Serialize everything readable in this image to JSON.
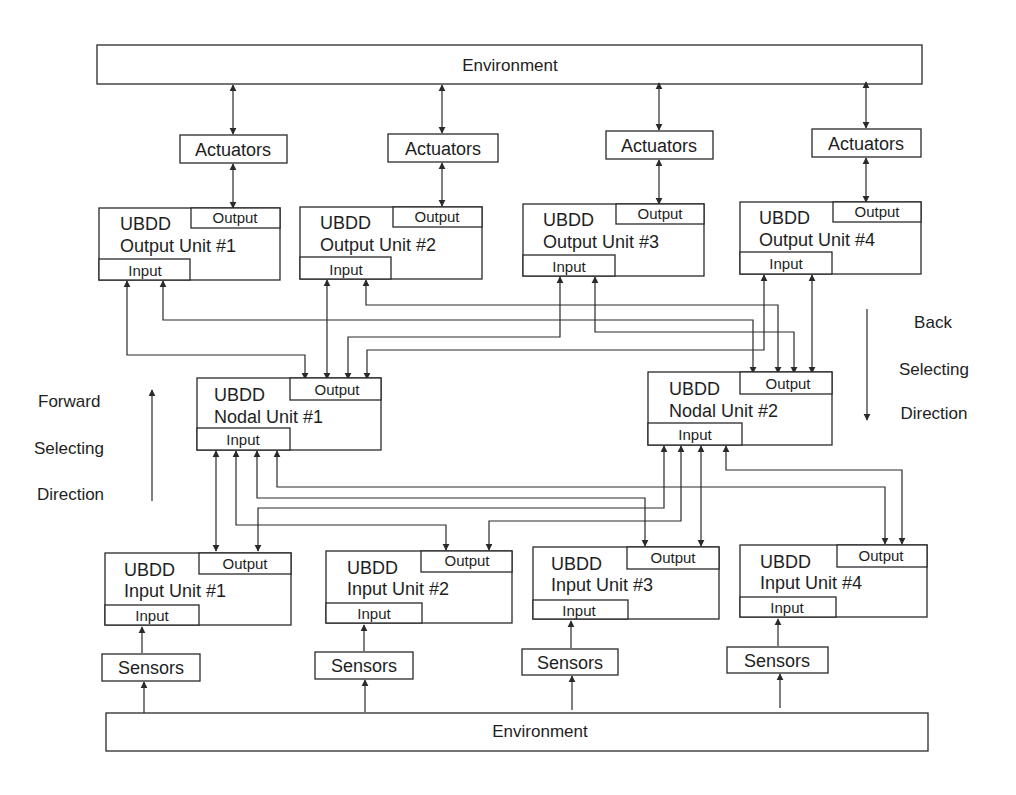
{
  "diagram": {
    "environment_top": "Environment",
    "environment_bottom": "Environment",
    "actuators": [
      "Actuators",
      "Actuators",
      "Actuators",
      "Actuators"
    ],
    "sensors": [
      "Sensors",
      "Sensors",
      "Sensors",
      "Sensors"
    ],
    "output_units": [
      {
        "title": "UBDD",
        "name": "Output Unit #1",
        "output_port": "Output",
        "input_port": "Input"
      },
      {
        "title": "UBDD",
        "name": "Output Unit #2",
        "output_port": "Output",
        "input_port": "Input"
      },
      {
        "title": "UBDD",
        "name": "Output Unit #3",
        "output_port": "Output",
        "input_port": "Input"
      },
      {
        "title": "UBDD",
        "name": "Output Unit #4",
        "output_port": "Output",
        "input_port": "Input"
      }
    ],
    "nodal_units": [
      {
        "title": "UBDD",
        "name": "Nodal Unit #1",
        "output_port": "Output",
        "input_port": "Input"
      },
      {
        "title": "UBDD",
        "name": "Nodal Unit #2",
        "output_port": "Output",
        "input_port": "Input"
      }
    ],
    "input_units": [
      {
        "title": "UBDD",
        "name": "Input Unit #1",
        "output_port": "Output",
        "input_port": "Input"
      },
      {
        "title": "UBDD",
        "name": "Input Unit #2",
        "output_port": "Output",
        "input_port": "Input"
      },
      {
        "title": "UBDD",
        "name": "Input Unit #3",
        "output_port": "Output",
        "input_port": "Input"
      },
      {
        "title": "UBDD",
        "name": "Input Unit #4",
        "output_port": "Output",
        "input_port": "Input"
      }
    ],
    "forward_direction": [
      "Forward",
      "Selecting",
      "Direction"
    ],
    "back_direction": [
      "Back",
      "Selecting",
      "Direction"
    ],
    "colors": {
      "line": "#2a2a2a",
      "background": "#ffffff",
      "text": "#1e1e1e"
    }
  }
}
